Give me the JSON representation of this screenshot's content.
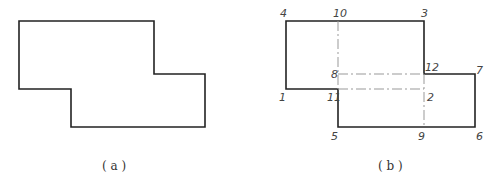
{
  "figure_a": {
    "caption": "( a )",
    "outline_points": [
      [
        19,
        21
      ],
      [
        154,
        21
      ],
      [
        154,
        74
      ],
      [
        205,
        74
      ],
      [
        205,
        127
      ],
      [
        71,
        127
      ],
      [
        71,
        89
      ],
      [
        19,
        89
      ]
    ]
  },
  "figure_b": {
    "caption": "( b )",
    "outline_points": [
      [
        286,
        21
      ],
      [
        424,
        21
      ],
      [
        424,
        74
      ],
      [
        475,
        74
      ],
      [
        475,
        127
      ],
      [
        338,
        127
      ],
      [
        338,
        89
      ],
      [
        286,
        89
      ]
    ],
    "dash_lines": [
      [
        [
          338,
          21
        ],
        [
          338,
          89
        ]
      ],
      [
        [
          338,
          74
        ],
        [
          424,
          74
        ]
      ],
      [
        [
          338,
          89
        ],
        [
          424,
          89
        ]
      ],
      [
        [
          424,
          74
        ],
        [
          424,
          127
        ]
      ]
    ],
    "point_labels": [
      {
        "text": "1",
        "x": 279,
        "y": 92
      },
      {
        "text": "2",
        "x": 427,
        "y": 92
      },
      {
        "text": "3",
        "x": 421,
        "y": 8
      },
      {
        "text": "4",
        "x": 280,
        "y": 8
      },
      {
        "text": "5",
        "x": 331,
        "y": 131
      },
      {
        "text": "6",
        "x": 476,
        "y": 131
      },
      {
        "text": "7",
        "x": 476,
        "y": 65
      },
      {
        "text": "8",
        "x": 331,
        "y": 69
      },
      {
        "text": "9",
        "x": 418,
        "y": 131
      },
      {
        "text": "10",
        "x": 333,
        "y": 8
      },
      {
        "text": "11",
        "x": 327,
        "y": 92
      },
      {
        "text": "12",
        "x": 425,
        "y": 62
      }
    ]
  },
  "colors": {
    "outline": "#222222",
    "dash": "#999999",
    "label": "#444444"
  }
}
